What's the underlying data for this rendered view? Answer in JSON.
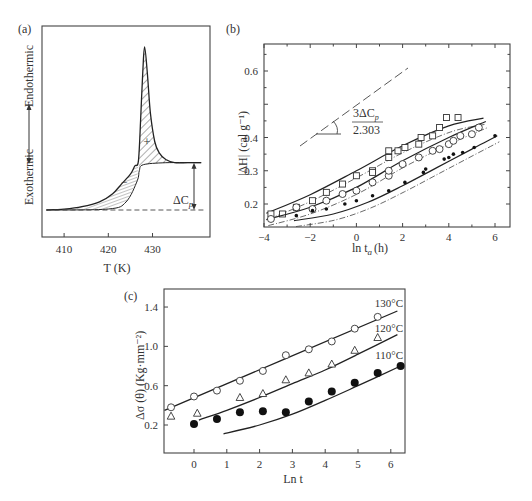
{
  "chart_data": [
    {
      "id": "a",
      "panel_label": "(a)",
      "type": "line",
      "title": "",
      "xlabel": "T (K)",
      "ylabel_top": "Endothermic",
      "ylabel_bottom": "Exothermic",
      "xticks": [
        "410",
        "420",
        "430"
      ],
      "xlim": [
        405,
        443
      ],
      "annotations": [
        "ΔC_p",
        "+",
        "−"
      ],
      "delta_cp_label": "ΔC",
      "delta_cp_sub": "p",
      "plus_sign": "+",
      "minus_sign": "−",
      "curve_T": [
        406,
        410,
        414,
        418,
        421,
        423,
        425,
        426,
        426.8,
        427.3,
        427.8,
        428.2,
        428.8,
        429.5,
        430.5,
        431.5,
        433,
        435,
        438,
        441
      ],
      "curve_signal": [
        0,
        0.005,
        0.02,
        0.05,
        0.1,
        0.16,
        0.22,
        0.27,
        0.3,
        0.55,
        0.85,
        1.0,
        0.85,
        0.6,
        0.42,
        0.35,
        0.31,
        0.29,
        0.29,
        0.29
      ],
      "baseline_level": 0,
      "step_level": 0.29,
      "step_T": 427
    },
    {
      "id": "b",
      "panel_label": "(b)",
      "type": "scatter",
      "xlabel": "ln t",
      "xlabel_sub": "a",
      "xlabel_unit": "(h)",
      "ylabel": "|ΔH| (cal g⁻¹)",
      "xlim": [
        -4,
        6.6
      ],
      "ylim": [
        0.15,
        0.66
      ],
      "xticks": [
        -4,
        -2,
        0,
        2,
        4,
        6
      ],
      "xtick_labels": [
        "−4",
        "−2",
        "0",
        "2",
        "4",
        "6"
      ],
      "yticks": [
        0.2,
        0.3,
        0.4,
        0.5,
        0.6
      ],
      "ytick_labels": [
        "0.2",
        "0.3",
        "0.4",
        "",
        "0.6"
      ],
      "slope_label_num": "3ΔC",
      "slope_label_sub": "p",
      "slope_label_den": "2.303",
      "series": [
        {
          "name": "squares",
          "marker": "square",
          "x": [
            -3.7,
            -3.2,
            -2.6,
            -1.9,
            -1.3,
            -0.6,
            0.0,
            0.7,
            0.7,
            1.4,
            1.4,
            1.8,
            2.1,
            2.7,
            2.8,
            3.3,
            3.6,
            3.9,
            4.4
          ],
          "y": [
            0.17,
            0.17,
            0.19,
            0.21,
            0.235,
            0.26,
            0.285,
            0.3,
            0.295,
            0.34,
            0.36,
            0.36,
            0.37,
            0.38,
            0.4,
            0.405,
            0.43,
            0.46,
            0.46
          ],
          "fit_x": [
            -3.9,
            -2,
            0,
            2,
            4,
            5.5
          ],
          "fit_y": [
            0.172,
            0.228,
            0.3,
            0.375,
            0.435,
            0.458
          ]
        },
        {
          "name": "circles",
          "marker": "circle",
          "x": [
            -3.7,
            -2.6,
            -1.9,
            -1.3,
            -0.6,
            0.0,
            0.7,
            1.4,
            1.4,
            2.0,
            2.7,
            3.3,
            3.6,
            4.0,
            4.2,
            4.5,
            5.0,
            5.3
          ],
          "y": [
            0.155,
            0.19,
            0.185,
            0.21,
            0.23,
            0.24,
            0.265,
            0.285,
            0.3,
            0.32,
            0.34,
            0.36,
            0.365,
            0.38,
            0.39,
            0.405,
            0.41,
            0.43
          ],
          "fit_x": [
            -3.9,
            -2,
            0,
            2,
            4,
            5.6
          ],
          "fit_y": [
            0.153,
            0.19,
            0.25,
            0.33,
            0.4,
            0.448
          ]
        },
        {
          "name": "filled dots",
          "marker": "dot",
          "x": [
            -2.6,
            -1.9,
            -1.3,
            -0.5,
            0.0,
            0.7,
            1.4,
            2.1,
            2.9,
            3.0,
            3.8,
            4.0,
            4.2,
            4.6,
            5.1,
            6.0
          ],
          "y": [
            0.165,
            0.18,
            0.185,
            0.2,
            0.21,
            0.225,
            0.24,
            0.265,
            0.295,
            0.305,
            0.335,
            0.34,
            0.35,
            0.355,
            0.37,
            0.405
          ],
          "fit_x": [
            -2.7,
            -1,
            0.5,
            2,
            3.5,
            5,
            6.1
          ],
          "fit_y": [
            0.15,
            0.17,
            0.205,
            0.255,
            0.31,
            0.365,
            0.405
          ]
        }
      ]
    },
    {
      "id": "c",
      "panel_label": "(c)",
      "type": "scatter",
      "xlabel": "Ln t",
      "ylabel": "Δσ (θ) (Kg·mm⁻²)",
      "xlim": [
        -0.9,
        6.5
      ],
      "ylim": [
        -0.05,
        1.55
      ],
      "xticks": [
        0,
        1,
        2,
        3,
        4,
        5,
        6
      ],
      "xtick_labels": [
        "0",
        "1",
        "2",
        "3",
        "4",
        "5",
        "6"
      ],
      "yticks": [
        0.2,
        0.6,
        1.0,
        1.4
      ],
      "ytick_labels": [
        "0.2",
        "0.6",
        "1.0",
        "1.4"
      ],
      "series": [
        {
          "name": "130°C",
          "marker": "circle",
          "x": [
            -0.7,
            0.0,
            0.7,
            1.4,
            2.1,
            2.8,
            3.5,
            4.2,
            4.9,
            5.6
          ],
          "y": [
            0.38,
            0.49,
            0.55,
            0.65,
            0.75,
            0.91,
            0.97,
            1.05,
            1.18,
            1.3
          ],
          "fit_x": [
            -0.9,
            6.2
          ],
          "fit_y": [
            0.35,
            1.36
          ]
        },
        {
          "name": "120°C",
          "marker": "triangle",
          "x": [
            -0.7,
            0.1,
            1.4,
            2.1,
            2.8,
            3.5,
            4.2,
            4.9,
            5.6
          ],
          "y": [
            0.29,
            0.32,
            0.48,
            0.52,
            0.66,
            0.73,
            0.82,
            0.96,
            1.09
          ],
          "fit_x": [
            0.15,
            1,
            2,
            3,
            4,
            5,
            6.2
          ],
          "fit_y": [
            0.25,
            0.35,
            0.48,
            0.62,
            0.76,
            0.92,
            1.12
          ]
        },
        {
          "name": "110°C",
          "marker": "dot",
          "x": [
            0.0,
            0.7,
            1.4,
            2.1,
            2.8,
            3.5,
            4.2,
            4.9,
            5.6,
            6.3
          ],
          "y": [
            0.21,
            0.26,
            0.33,
            0.34,
            0.33,
            0.44,
            0.54,
            0.63,
            0.73,
            0.8
          ],
          "fit_x": [
            0.9,
            2,
            3,
            4,
            5,
            6.3
          ],
          "fit_y": [
            0.11,
            0.2,
            0.31,
            0.45,
            0.6,
            0.8
          ]
        }
      ]
    }
  ]
}
